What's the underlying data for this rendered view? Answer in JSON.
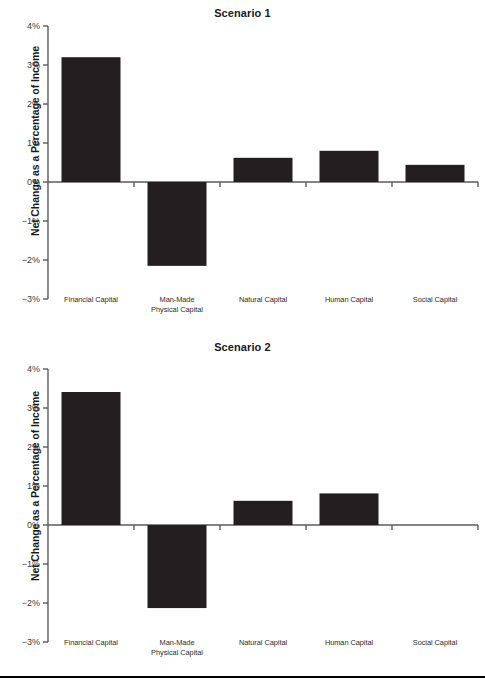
{
  "page": {
    "ylabel": "Net Change as a Percentage of Income",
    "bar_color": "#231f20",
    "axis_color": "#5b5b5b",
    "background": "#ffffff"
  },
  "charts": [
    {
      "title": "Scenario 1",
      "ylabel": "Net Change as a Percentage of Income",
      "yticks": [
        "4%",
        "3%",
        "2%",
        "1%",
        "0%",
        "−1%",
        "−2%",
        "−3%"
      ],
      "categories": [
        "Financial Capital",
        "Man-Made\nPhysical Capital",
        "Natural Capital",
        "Human Capital",
        "Social Capital"
      ],
      "cat_lines": [
        [
          "Financial Capital"
        ],
        [
          "Man-Made",
          "Physical Capital"
        ],
        [
          "Natural Capital"
        ],
        [
          "Human Capital"
        ],
        [
          "Social Capital"
        ]
      ],
      "values": [
        3.2,
        -2.15,
        0.62,
        0.8,
        0.44
      ]
    },
    {
      "title": "Scenario 2",
      "ylabel": "Net Change as a Percentage of Income",
      "yticks": [
        "4%",
        "3%",
        "2%",
        "1%",
        "0%",
        "−1%",
        "−2%",
        "−3%"
      ],
      "categories": [
        "Financial Capital",
        "Man-Made\nPhysical Capital",
        "Natural Capital",
        "Human Capital",
        "Social Capital"
      ],
      "cat_lines": [
        [
          "Financial Capital"
        ],
        [
          "Man-Made",
          "Physical Capital"
        ],
        [
          "Natural Capital"
        ],
        [
          "Human Capital"
        ],
        [
          "Social Capital"
        ]
      ],
      "values": [
        3.41,
        -2.13,
        0.62,
        0.81,
        0.0
      ]
    }
  ],
  "chart_data": [
    {
      "type": "bar",
      "title": "Scenario 1",
      "xlabel": "",
      "ylabel": "Net Change as a Percentage of Income",
      "categories": [
        "Financial Capital",
        "Man-Made Physical Capital",
        "Natural Capital",
        "Human Capital",
        "Social Capital"
      ],
      "values": [
        3.2,
        -2.15,
        0.62,
        0.8,
        0.44
      ],
      "ylim": [
        -3,
        4
      ],
      "ytick_values": [
        4,
        3,
        2,
        1,
        0,
        -1,
        -2,
        -3
      ],
      "ytick_labels": [
        "4%",
        "3%",
        "2%",
        "1%",
        "0%",
        "−1%",
        "−2%",
        "−3%"
      ],
      "grid": false,
      "legend": "none",
      "units": "percent"
    },
    {
      "type": "bar",
      "title": "Scenario 2",
      "xlabel": "",
      "ylabel": "Net Change as a Percentage of Income",
      "categories": [
        "Financial Capital",
        "Man-Made Physical Capital",
        "Natural Capital",
        "Human Capital",
        "Social Capital"
      ],
      "values": [
        3.41,
        -2.13,
        0.62,
        0.81,
        0.0
      ],
      "ylim": [
        -3,
        4
      ],
      "ytick_values": [
        4,
        3,
        2,
        1,
        0,
        -1,
        -2,
        -3
      ],
      "ytick_labels": [
        "4%",
        "3%",
        "2%",
        "1%",
        "0%",
        "−1%",
        "−2%",
        "−3%"
      ],
      "grid": false,
      "legend": "none",
      "units": "percent"
    }
  ]
}
